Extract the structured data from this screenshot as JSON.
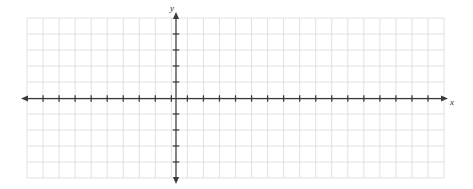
{
  "figure": {
    "kind": "blank-cartesian-coordinate-grid",
    "background_color": "#ffffff",
    "width": 473,
    "height": 189
  },
  "chart_data": {
    "type": "scatter",
    "title": "",
    "subtitle": "",
    "xlabel": "x",
    "ylabel": "y",
    "series": [
      {
        "name": "",
        "x": [],
        "y": []
      }
    ],
    "x": [],
    "values": [],
    "categories": [],
    "xlim": [
      -9,
      17
    ],
    "ylim": [
      -5,
      5
    ],
    "xticks": [
      -9,
      -8,
      -7,
      -6,
      -5,
      -4,
      -3,
      -2,
      -1,
      0,
      1,
      2,
      3,
      4,
      5,
      6,
      7,
      8,
      9,
      10,
      11,
      12,
      13,
      14,
      15,
      16,
      17
    ],
    "yticks": [
      -5,
      -4,
      -3,
      -2,
      -1,
      0,
      1,
      2,
      3,
      4,
      5
    ],
    "xtick_labels": [],
    "ytick_labels": [],
    "grid": true,
    "grid_columns": 26,
    "grid_rows": 10,
    "grid_spacing_px": 16.04,
    "legend": [],
    "legend_position": "none",
    "annotations": [],
    "data_labels": []
  },
  "geometry": {
    "grid_left": 27,
    "grid_top": 18,
    "grid_right": 444,
    "grid_bottom": 178,
    "origin_x": 176,
    "origin_y": 98.5,
    "tick_spacing_x": 16.04,
    "tick_spacing_y": 16.0,
    "tick_half_length": 3.2,
    "arrow_length": 7,
    "x_axis_left_end": 28,
    "x_axis_right_end": 441,
    "y_axis_top_end": 19,
    "y_axis_bottom_end": 177
  },
  "style": {
    "grid_color": "#d9d9d9",
    "grid_width": 0.8,
    "axis_color": "#3a3a3a",
    "axis_width": 1.25,
    "tick_color": "#3a3a3a",
    "tick_width": 1.25,
    "label_color": "#2b2b2b",
    "label_font_size": 9
  },
  "labels": {
    "x_axis": "x",
    "y_axis": "y"
  }
}
